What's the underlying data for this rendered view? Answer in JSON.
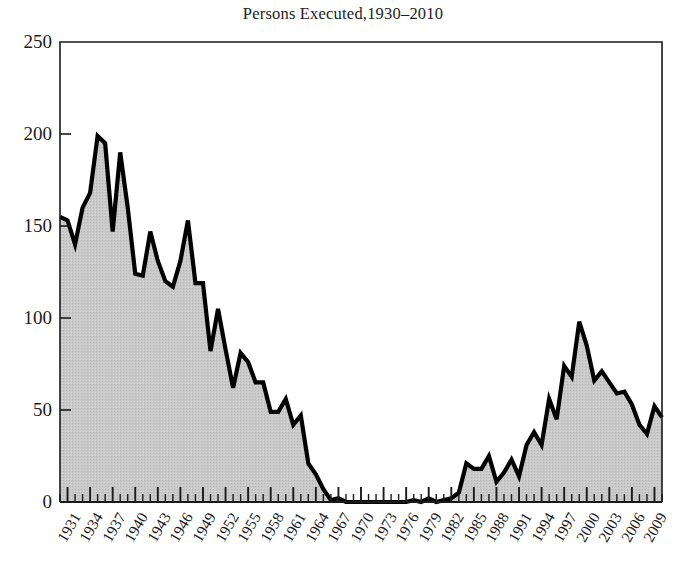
{
  "chart_data": {
    "type": "area",
    "title": "Persons Executed,1930–2010",
    "xlabel": "",
    "ylabel": "",
    "ylim": [
      0,
      250
    ],
    "xlim": [
      1930,
      2010
    ],
    "yticks": [
      0,
      50,
      100,
      150,
      200,
      250
    ],
    "ytick_labels": [
      "0",
      "50",
      "100",
      "150",
      "200",
      "250"
    ],
    "xtick_labels": [
      "1931",
      "1934",
      "1937",
      "1940",
      "1943",
      "1946",
      "1949",
      "1952",
      "1955",
      "1958",
      "1961",
      "1964",
      "1967",
      "1970",
      "1973",
      "1976",
      "1979",
      "1982",
      "1985",
      "1988",
      "1991",
      "1994",
      "1997",
      "2000",
      "2003",
      "2006",
      "2009"
    ],
    "grid": false,
    "legend": "none",
    "line_color": "#000000",
    "fill_color": "#c6c6c6",
    "axis_color": "#1a1a1a",
    "series_name": "Persons Executed",
    "x": [
      1930,
      1931,
      1932,
      1933,
      1934,
      1935,
      1936,
      1937,
      1938,
      1939,
      1940,
      1941,
      1942,
      1943,
      1944,
      1945,
      1946,
      1947,
      1948,
      1949,
      1950,
      1951,
      1952,
      1953,
      1954,
      1955,
      1956,
      1957,
      1958,
      1959,
      1960,
      1961,
      1962,
      1963,
      1964,
      1965,
      1966,
      1967,
      1968,
      1969,
      1970,
      1971,
      1972,
      1973,
      1974,
      1975,
      1976,
      1977,
      1978,
      1979,
      1980,
      1981,
      1982,
      1983,
      1984,
      1985,
      1986,
      1987,
      1988,
      1989,
      1990,
      1991,
      1992,
      1993,
      1994,
      1995,
      1996,
      1997,
      1998,
      1999,
      2000,
      2001,
      2002,
      2003,
      2004,
      2005,
      2006,
      2007,
      2008,
      2009,
      2010
    ],
    "values": [
      155,
      153,
      140,
      160,
      168,
      199,
      195,
      147,
      190,
      160,
      124,
      123,
      147,
      131,
      120,
      117,
      131,
      153,
      119,
      119,
      82,
      105,
      83,
      62,
      81,
      76,
      65,
      65,
      49,
      49,
      56,
      42,
      47,
      21,
      15,
      7,
      1,
      2,
      0,
      0,
      0,
      0,
      0,
      0,
      0,
      0,
      0,
      1,
      0,
      2,
      0,
      1,
      2,
      5,
      21,
      18,
      18,
      25,
      11,
      16,
      23,
      14,
      31,
      38,
      31,
      56,
      45,
      74,
      68,
      98,
      85,
      66,
      71,
      65,
      59,
      60,
      53,
      42,
      37,
      52,
      46
    ],
    "source_note": ""
  },
  "figure": {
    "plot_left": 60,
    "plot_right": 662,
    "plot_top": 42,
    "plot_bottom": 502
  }
}
